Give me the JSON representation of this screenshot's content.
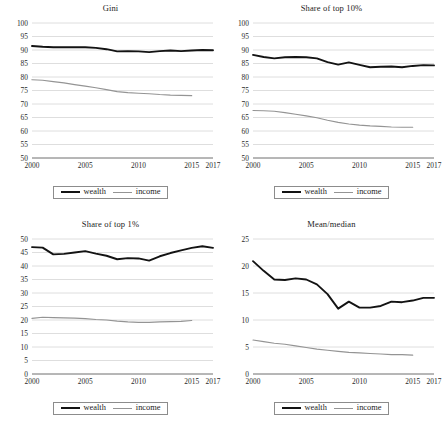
{
  "figure": {
    "panel_count": 4,
    "legend": {
      "entries": [
        {
          "label": "wealth",
          "color": "#131313",
          "style": "thick-black-line"
        },
        {
          "label": "income",
          "color": "#949494",
          "style": "thin-gray-line"
        }
      ]
    }
  },
  "chart_data": [
    {
      "type": "line",
      "title": "Gini",
      "xlabel": "",
      "ylabel": "",
      "grid": true,
      "legend_position": "bottom-center",
      "xlim": [
        2000,
        2017
      ],
      "ylim": [
        50,
        100
      ],
      "yticks": [
        50,
        55,
        60,
        65,
        70,
        75,
        80,
        85,
        90,
        95,
        100
      ],
      "xticks": [
        2000,
        2005,
        2010,
        2015,
        2017
      ],
      "xtick_labels": [
        "2000",
        "2005",
        "2010",
        "2015",
        "2017"
      ],
      "x": [
        2000,
        2001,
        2002,
        2003,
        2004,
        2005,
        2006,
        2007,
        2008,
        2009,
        2010,
        2011,
        2012,
        2013,
        2014,
        2015,
        2016,
        2017
      ],
      "series": [
        {
          "name": "wealth",
          "color": "#131313",
          "values": [
            91.5,
            91.2,
            91.0,
            91.0,
            91.0,
            91.0,
            90.8,
            90.3,
            89.5,
            89.6,
            89.5,
            89.2,
            89.6,
            89.8,
            89.6,
            89.8,
            90.0,
            89.9
          ]
        },
        {
          "name": "income",
          "color": "#949494",
          "values": [
            79.0,
            78.8,
            78.3,
            77.8,
            77.2,
            76.6,
            76.0,
            75.3,
            74.6,
            74.2,
            74.0,
            73.8,
            73.5,
            73.3,
            73.2,
            73.1,
            null,
            null
          ]
        }
      ]
    },
    {
      "type": "line",
      "title": "Share of top 10%",
      "xlabel": "",
      "ylabel": "",
      "grid": true,
      "legend_position": "bottom-center",
      "xlim": [
        2000,
        2017
      ],
      "ylim": [
        50,
        100
      ],
      "yticks": [
        50,
        55,
        60,
        65,
        70,
        75,
        80,
        85,
        90,
        95,
        100
      ],
      "xticks": [
        2000,
        2005,
        2010,
        2015,
        2017
      ],
      "xtick_labels": [
        "2000",
        "2005",
        "2010",
        "2015",
        "2017"
      ],
      "x": [
        2000,
        2001,
        2002,
        2003,
        2004,
        2005,
        2006,
        2007,
        2008,
        2009,
        2010,
        2011,
        2012,
        2013,
        2014,
        2015,
        2016,
        2017
      ],
      "series": [
        {
          "name": "wealth",
          "color": "#131313",
          "values": [
            88.2,
            87.4,
            86.9,
            87.3,
            87.4,
            87.3,
            86.9,
            85.5,
            84.6,
            85.4,
            84.5,
            83.6,
            83.8,
            83.9,
            83.6,
            84.1,
            84.4,
            84.3
          ]
        },
        {
          "name": "income",
          "color": "#949494",
          "values": [
            67.6,
            67.5,
            67.3,
            66.8,
            66.2,
            65.6,
            64.9,
            64.0,
            63.2,
            62.6,
            62.2,
            61.9,
            61.7,
            61.5,
            61.4,
            61.4,
            null,
            null
          ]
        }
      ]
    },
    {
      "type": "line",
      "title": "Share of top 1%",
      "xlabel": "",
      "ylabel": "",
      "grid": true,
      "legend_position": "bottom-center",
      "xlim": [
        2000,
        2017
      ],
      "ylim": [
        0,
        50
      ],
      "yticks": [
        0,
        5,
        10,
        15,
        20,
        25,
        30,
        35,
        40,
        45,
        50
      ],
      "xticks": [
        2000,
        2005,
        2010,
        2015,
        2017
      ],
      "xtick_labels": [
        "2000",
        "2005",
        "2010",
        "2015",
        "2017"
      ],
      "x": [
        2000,
        2001,
        2002,
        2003,
        2004,
        2005,
        2006,
        2007,
        2008,
        2009,
        2010,
        2011,
        2012,
        2013,
        2014,
        2015,
        2016,
        2017
      ],
      "series": [
        {
          "name": "wealth",
          "color": "#131313",
          "values": [
            47.0,
            46.8,
            44.3,
            44.5,
            45.0,
            45.5,
            44.6,
            43.8,
            42.5,
            42.9,
            42.8,
            42.0,
            43.6,
            44.8,
            45.8,
            46.7,
            47.3,
            46.7
          ]
        },
        {
          "name": "income",
          "color": "#949494",
          "values": [
            20.6,
            21.0,
            20.9,
            20.8,
            20.7,
            20.5,
            20.2,
            20.0,
            19.6,
            19.3,
            19.1,
            19.1,
            19.3,
            19.4,
            19.5,
            19.8,
            null,
            null
          ]
        }
      ]
    },
    {
      "type": "line",
      "title": "Mean/median",
      "xlabel": "",
      "ylabel": "",
      "grid": true,
      "legend_position": "bottom-center",
      "xlim": [
        2000,
        2017
      ],
      "ylim": [
        0,
        25
      ],
      "yticks": [
        0,
        5,
        10,
        15,
        20,
        25
      ],
      "xticks": [
        2000,
        2005,
        2010,
        2015,
        2017
      ],
      "xtick_labels": [
        "2000",
        "2005",
        "2010",
        "2015",
        "2017"
      ],
      "x": [
        2000,
        2001,
        2002,
        2003,
        2004,
        2005,
        2006,
        2007,
        2008,
        2009,
        2010,
        2011,
        2012,
        2013,
        2014,
        2015,
        2016,
        2017
      ],
      "series": [
        {
          "name": "wealth",
          "color": "#131313",
          "values": [
            20.9,
            19.1,
            17.5,
            17.4,
            17.7,
            17.5,
            16.6,
            14.8,
            12.1,
            13.4,
            12.3,
            12.3,
            12.6,
            13.4,
            13.3,
            13.6,
            14.1,
            14.1
          ]
        },
        {
          "name": "income",
          "color": "#949494",
          "values": [
            6.3,
            6.0,
            5.7,
            5.5,
            5.2,
            4.9,
            4.6,
            4.4,
            4.2,
            4.0,
            3.9,
            3.8,
            3.7,
            3.6,
            3.6,
            3.5,
            null,
            null
          ]
        }
      ]
    }
  ]
}
